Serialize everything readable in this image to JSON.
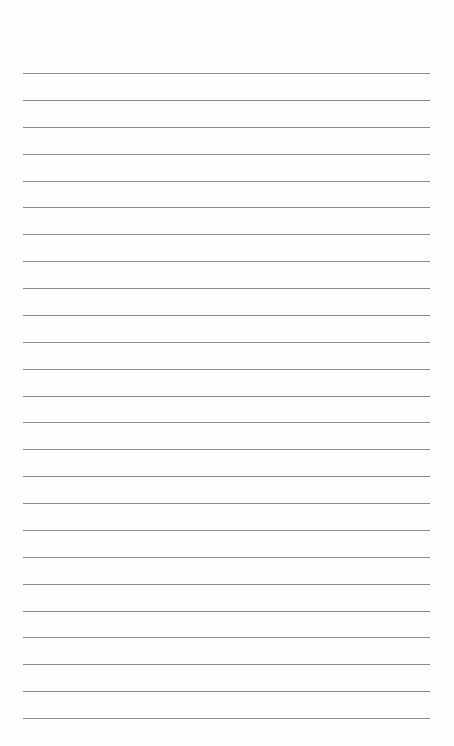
{
  "page": {
    "type": "lined-paper",
    "line_count": 25,
    "first_line_y": 73,
    "line_spacing": 26.875,
    "line_left": 23,
    "line_width": 407,
    "line_color": "#8a8a8a",
    "background": "#fdfdfd"
  }
}
